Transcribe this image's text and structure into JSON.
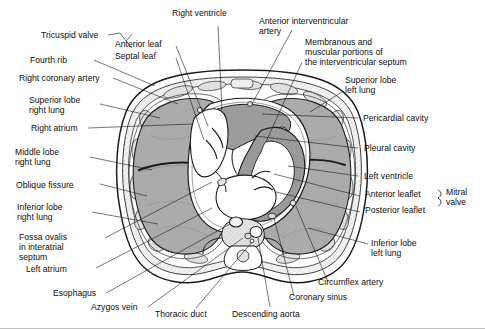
{
  "figure": {
    "type": "anatomical-cross-section",
    "orientation": "axial (cross-sectional) view",
    "fill_colors": {
      "lung_parenchyma": "#a9a9a9",
      "heart_chambers_wall": "#9a9a9a",
      "cavity_lumen": "#ffffff",
      "background": "#ffffff",
      "outline": "#1a1a1a",
      "leader_line": "#1a1a1a",
      "page_border": "#bdbdbd"
    }
  },
  "labels": {
    "left": [
      {
        "id": "tricuspid-valve",
        "text": "Tricuspid valve"
      },
      {
        "id": "fourth-rib",
        "text": "Fourth rib"
      },
      {
        "id": "right-coronary-artery",
        "text": "Right coronary artery"
      },
      {
        "id": "superior-lobe-right-lung",
        "line1": "Superior lobe",
        "line2": "right lung"
      },
      {
        "id": "right-atrium",
        "text": "Right atrium"
      },
      {
        "id": "middle-lobe-right-lung",
        "line1": "Middle lobe",
        "line2": "right lung"
      },
      {
        "id": "oblique-fissure",
        "text": "Oblique fissure"
      },
      {
        "id": "inferior-lobe-right-lung",
        "line1": "Inferior lobe",
        "line2": "right lung"
      },
      {
        "id": "fossa-ovalis",
        "line1": "Fossa ovalis",
        "line2": "in interatrial",
        "line3": "septum"
      },
      {
        "id": "left-atrium",
        "text": "Left atrium"
      },
      {
        "id": "esophagus",
        "text": "Esophagus"
      },
      {
        "id": "azygos-vein",
        "text": "Azygos vein"
      }
    ],
    "top": [
      {
        "id": "anterior-leaf",
        "text": "Anterior leaf"
      },
      {
        "id": "septal-leaf",
        "text": "Septal leaf"
      },
      {
        "id": "right-ventricle",
        "text": "Right ventricle"
      },
      {
        "id": "anterior-interventricular-artery",
        "line1": "Anterior interventricular",
        "line2": "artery"
      },
      {
        "id": "interventricular-septum",
        "line1": "Membranous and",
        "line2": "muscular portions of",
        "line3": "the interventricular septum"
      }
    ],
    "right": [
      {
        "id": "superior-lobe-left-lung",
        "line1": "Superior lobe",
        "line2": "left lung"
      },
      {
        "id": "pericardial-cavity",
        "text": "Pericardial cavity"
      },
      {
        "id": "pleural-cavity",
        "text": "Pleural cavity"
      },
      {
        "id": "left-ventricle",
        "text": "Left ventricle"
      },
      {
        "id": "anterior-leaflet",
        "text": "Anterior leaflet"
      },
      {
        "id": "posterior-leaflet",
        "text": "Posterior leaflet"
      },
      {
        "id": "mitral-valve",
        "line1": "Mitral",
        "line2": "valve"
      },
      {
        "id": "inferior-lobe-left-lung",
        "line1": "Inferior lobe",
        "line2": "left lung"
      },
      {
        "id": "circumflex-artery",
        "text": "Circumflex artery"
      },
      {
        "id": "coronary-sinus",
        "text": "Coronary sinus"
      }
    ],
    "bottom": [
      {
        "id": "thoracic-duct",
        "text": "Thoracic duct"
      },
      {
        "id": "descending-aorta",
        "text": "Descending aorta"
      }
    ]
  }
}
